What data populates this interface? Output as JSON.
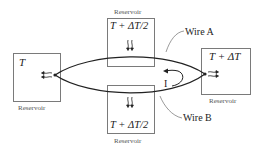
{
  "diagram": {
    "reservoirs": {
      "left": {
        "temp": "T",
        "label": "Reservoir"
      },
      "top": {
        "temp": "T + ΔT/2",
        "label": "Reservoir"
      },
      "bottom": {
        "temp": "T + ΔT/2",
        "label": "Reservoir"
      },
      "right": {
        "temp": "T + ΔT",
        "label": "Reservoir"
      }
    },
    "wires": {
      "a": "Wire A",
      "b": "Wire B"
    },
    "current_label": "I",
    "colors": {
      "line": "#222222",
      "box": "#7a7a7a",
      "label": "#555555"
    }
  }
}
